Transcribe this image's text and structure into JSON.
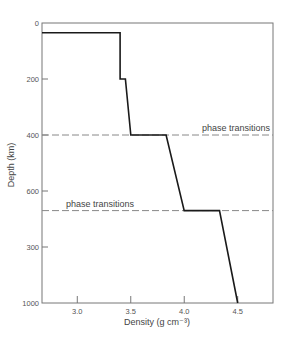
{
  "chart_data": {
    "type": "line",
    "title": "",
    "xlabel": "Density (g cm⁻³)",
    "ylabel": "Depth (km)",
    "xlim": [
      2.67,
      4.83
    ],
    "ylim": [
      0,
      1000
    ],
    "y_inverted": true,
    "grid": false,
    "legend": null,
    "x_ticks": [
      3.0,
      3.5,
      4.0,
      4.5
    ],
    "x_tick_labels": [
      "3.0",
      "3.5",
      "4.0",
      "4.5"
    ],
    "y_ticks": [
      0,
      200,
      400,
      600,
      800,
      1000
    ],
    "y_tick_labels": [
      "0",
      "200",
      "400",
      "600",
      "300",
      "1000"
    ],
    "series": [
      {
        "name": "density profile",
        "color": "#1a1a1a",
        "points": [
          {
            "density": 2.67,
            "depth": 35
          },
          {
            "density": 3.4,
            "depth": 35
          },
          {
            "density": 3.4,
            "depth": 200
          },
          {
            "density": 3.45,
            "depth": 200
          },
          {
            "density": 3.5,
            "depth": 400
          },
          {
            "density": 3.83,
            "depth": 400
          },
          {
            "density": 4.0,
            "depth": 670
          },
          {
            "density": 4.33,
            "depth": 670
          },
          {
            "density": 4.5,
            "depth": 1000
          }
        ]
      }
    ],
    "reference_lines": [
      {
        "depth": 400,
        "style": "dashed",
        "label": "phase transitions",
        "label_position": "right"
      },
      {
        "depth": 670,
        "style": "dashed",
        "label": "phase transitions",
        "label_position": "left"
      }
    ],
    "annotations": [
      "phase transitions",
      "phase transitions"
    ]
  },
  "colors": {
    "curve": "#1a1a1a",
    "axis": "#777777",
    "dashed": "#888888",
    "text": "#444444"
  }
}
